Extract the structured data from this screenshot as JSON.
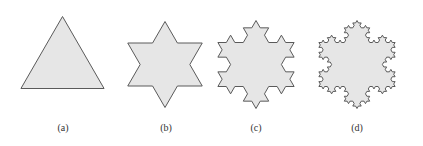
{
  "figure": {
    "panels": [
      {
        "id": "a",
        "caption": "(a)",
        "shape": "equilateral-triangle",
        "koch_iteration": 0
      },
      {
        "id": "b",
        "caption": "(b)",
        "shape": "koch-snowflake",
        "koch_iteration": 1
      },
      {
        "id": "c",
        "caption": "(c)",
        "shape": "koch-snowflake",
        "koch_iteration": 2
      },
      {
        "id": "d",
        "caption": "(d)",
        "shape": "koch-snowflake",
        "koch_iteration": 3
      }
    ],
    "colors": {
      "fill": "#e6e6e6",
      "stroke": "#5a5a5a",
      "background": "#ffffff"
    }
  }
}
